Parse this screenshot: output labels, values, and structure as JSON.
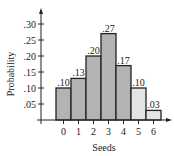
{
  "chart_data": {
    "type": "bar",
    "title": "",
    "xlabel": "Seeds",
    "ylabel": "Probability",
    "categories": [
      "0",
      "1",
      "2",
      "3",
      "4",
      "5",
      "6"
    ],
    "values": [
      0.1,
      0.13,
      0.2,
      0.27,
      0.17,
      0.1,
      0.03
    ],
    "data_labels": [
      ".10",
      ".13",
      ".20",
      ".27",
      ".17",
      ".10",
      ".03"
    ],
    "yticks": [
      ".05",
      ".10",
      ".15",
      ".20",
      ".25",
      ".30"
    ],
    "ytick_values": [
      0.05,
      0.1,
      0.15,
      0.2,
      0.25,
      0.3
    ],
    "ylim": [
      0,
      0.32
    ],
    "grid": false,
    "bar_colors": [
      "#b3b3b3",
      "#b3b3b3",
      "#b3b3b3",
      "#b3b3b3",
      "#b3b3b3",
      "#e3e3e3",
      "#e3e3e3"
    ]
  }
}
